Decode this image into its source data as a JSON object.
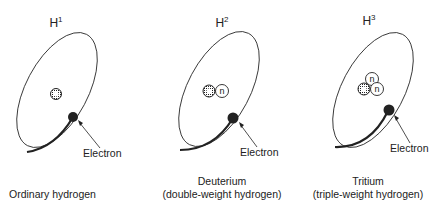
{
  "figure": {
    "panels": [
      {
        "symbol": "H",
        "mass_number": "1",
        "name": "Ordinary hydrogen",
        "subtitle": "",
        "electron_label": "Electron",
        "neutrons": 0
      },
      {
        "symbol": "H",
        "mass_number": "2",
        "name": "Deuterium",
        "subtitle": "(double-weight hydrogen)",
        "electron_label": "Electron",
        "neutrons": 1
      },
      {
        "symbol": "H",
        "mass_number": "3",
        "name": "Tritium",
        "subtitle": "(triple-weight hydrogen)",
        "electron_label": "Electron",
        "neutrons": 2
      }
    ],
    "neutron_label": "n",
    "colors": {
      "line": "#222222",
      "background": "#ffffff"
    }
  }
}
